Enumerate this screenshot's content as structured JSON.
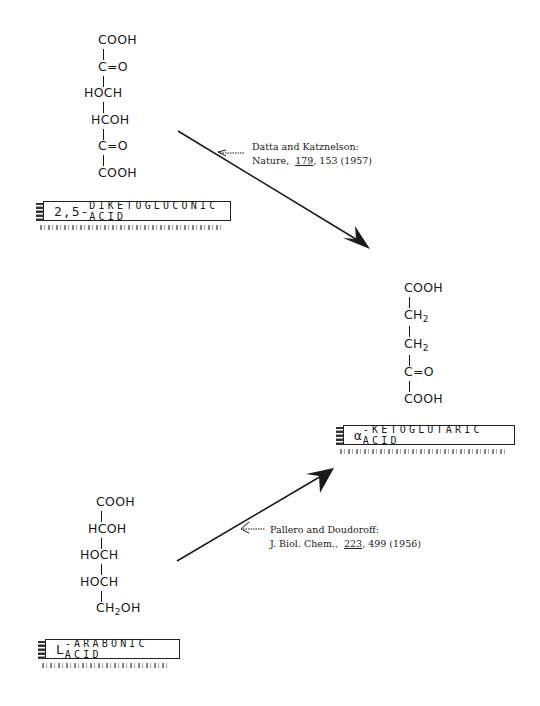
{
  "compounds": {
    "diketogluconic": {
      "name": "2,5-DIKETOGLUCONIC ACID",
      "name_prefix": "2,5-",
      "name_rest": "DIKETOGLUCONIC ACID",
      "structure": [
        "COOH",
        "C=O",
        "HOCH",
        "HCOH",
        "C=O",
        "COOH"
      ]
    },
    "ketoglutaric": {
      "name": "α-KETOGLUTARIC ACID",
      "name_prefix": "α",
      "name_rest": "-KETOGLUTARIC ACID",
      "structure": [
        "COOH",
        "CH2",
        "CH2",
        "C=O",
        "COOH"
      ]
    },
    "arabonic": {
      "name": "L-ARABONIC ACID",
      "name_prefix": "L",
      "name_rest": "-ARABONIC ACID",
      "structure": [
        "COOH",
        "HCOH",
        "HOCH",
        "HOCH",
        "CH2OH"
      ]
    }
  },
  "reactions": [
    {
      "from": "2,5-DIKETOGLUCONIC ACID",
      "to": "α-KETOGLUTARIC ACID",
      "citation": {
        "authors": "Datta and Katznelson:",
        "journal": "Nature,",
        "volume": "179",
        "pages_year": ", 153 (1957)"
      }
    },
    {
      "from": "L-ARABONIC ACID",
      "to": "α-KETOGLUTARIC ACID",
      "citation": {
        "authors": "Pallero and Doudoroff:",
        "journal": "J. Biol. Chem.,",
        "volume": "223",
        "pages_year": ", 499 (1956)"
      }
    }
  ],
  "colors": {
    "ink": "#1a1a1a",
    "background": "#ffffff"
  }
}
